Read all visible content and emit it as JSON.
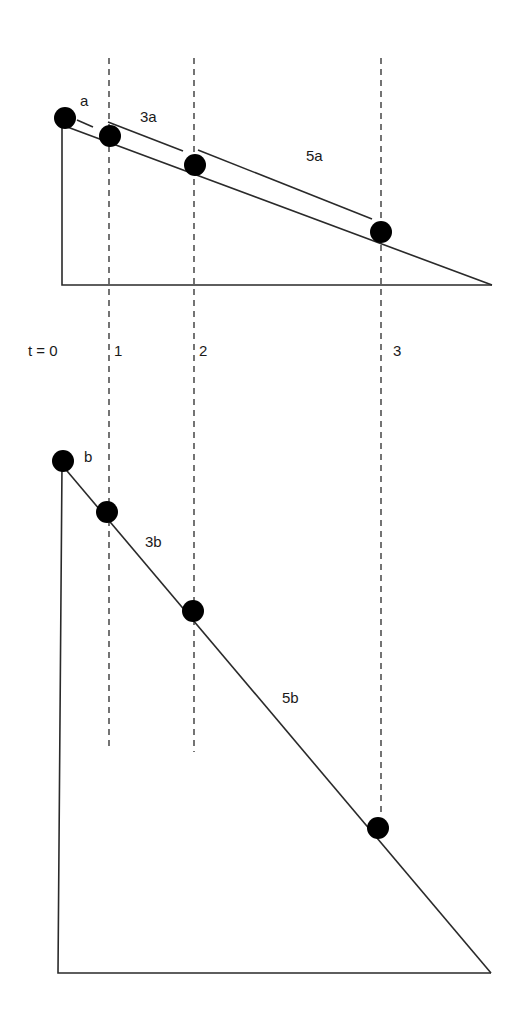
{
  "figure": {
    "time_labels": [
      {
        "text": "t =  0",
        "x": 28,
        "y": 356
      },
      {
        "text": "1",
        "x": 114,
        "y": 356
      },
      {
        "text": "2",
        "x": 199,
        "y": 356
      },
      {
        "text": "3",
        "x": 393,
        "y": 356
      }
    ],
    "incline_a": {
      "label": "a",
      "distance_labels": [
        {
          "text": "a",
          "x": 80,
          "y": 106
        },
        {
          "text": "3a",
          "x": 140,
          "y": 122
        },
        {
          "text": "5a",
          "x": 306,
          "y": 161
        }
      ],
      "triangle": {
        "top": [
          62,
          125
        ],
        "corner": [
          62,
          285
        ],
        "end": [
          492,
          285
        ]
      },
      "balls": [
        {
          "t": 0,
          "cx": 65,
          "cy": 118
        },
        {
          "t": 1,
          "cx": 110,
          "cy": 136
        },
        {
          "t": 2,
          "cx": 195,
          "cy": 165
        },
        {
          "t": 3,
          "cx": 381,
          "cy": 232
        }
      ],
      "brackets": [
        {
          "from": [
            77,
            120
          ],
          "to": [
            93,
            127
          ]
        },
        {
          "from": [
            108,
            122
          ],
          "to": [
            183,
            151
          ]
        },
        {
          "from": [
            198,
            150
          ],
          "to": [
            372,
            219
          ]
        }
      ]
    },
    "incline_b": {
      "label": "b",
      "distance_labels": [
        {
          "text": "b",
          "x": 84,
          "y": 462
        },
        {
          "text": "3b",
          "x": 145,
          "y": 547
        },
        {
          "text": "5b",
          "x": 282,
          "y": 703
        }
      ],
      "triangle": {
        "top": [
          62,
          465
        ],
        "corner": [
          58,
          973
        ],
        "end": [
          491,
          973
        ]
      },
      "balls": [
        {
          "t": 0,
          "cx": 63,
          "cy": 461
        },
        {
          "t": 1,
          "cx": 107,
          "cy": 512
        },
        {
          "t": 2,
          "cx": 193,
          "cy": 611
        },
        {
          "t": 3,
          "cx": 378,
          "cy": 828
        }
      ]
    },
    "guides": [
      {
        "x": 109,
        "y1": 58,
        "y2": 750
      },
      {
        "x": 194,
        "y1": 58,
        "y2": 752
      },
      {
        "x": 381,
        "y1": 58,
        "y2": 816
      }
    ],
    "colors": {
      "stroke": "#2a2a2a",
      "ball": "#000000",
      "background": "#ffffff"
    }
  }
}
